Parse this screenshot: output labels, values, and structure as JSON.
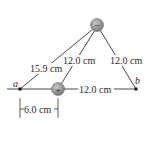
{
  "diagram": {
    "charges": {
      "negative": {
        "sign": "−",
        "label": "negative-charge"
      },
      "positive": {
        "sign": "+",
        "label": "positive-charge"
      }
    },
    "points": {
      "a": "a",
      "b": "b"
    },
    "distances": {
      "a_to_negative": "15.9 cm",
      "positive_to_negative": "12.0 cm",
      "negative_to_b": "12.0 cm",
      "positive_to_b": "12.0 cm",
      "a_to_positive": "6.0 cm"
    },
    "colors": {
      "line": "#333333",
      "charge_fill": "#9a9a9a",
      "charge_edge": "#6e6e6e",
      "point": "#111111",
      "background": "#ffffff"
    }
  }
}
